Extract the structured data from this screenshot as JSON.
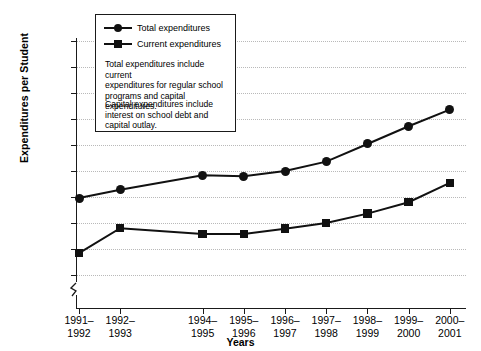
{
  "chart_data": {
    "type": "line",
    "title": "",
    "xlabel": "Years",
    "ylabel": "Expenditures per Student",
    "categories": [
      "1991–\n1992",
      "1992–\n1993",
      "1994–\n1995",
      "1995–\n1996",
      "1996–\n1997",
      "1997–\n1998",
      "1998–\n1999",
      "1999–\n2000",
      "2000–\n2001"
    ],
    "category_lines": [
      [
        "1991–",
        "1992"
      ],
      [
        "1992–",
        "1993"
      ],
      [
        "1994–",
        "1995"
      ],
      [
        "1995–",
        "1996"
      ],
      [
        "1996–",
        "1997"
      ],
      [
        "1997–",
        "1998"
      ],
      [
        "1998–",
        "1999"
      ],
      [
        "1999–",
        "2000"
      ],
      [
        "2000–",
        "2001"
      ]
    ],
    "series": [
      {
        "name": "Total expenditures",
        "marker": "circle",
        "values": [
          6980,
          7140,
          7420,
          7400,
          7500,
          7680,
          8020,
          8360,
          8680
        ]
      },
      {
        "name": "Current expenditures",
        "marker": "square",
        "values": [
          5920,
          6400,
          6290,
          6290,
          6390,
          6500,
          6680,
          6900,
          7270
        ]
      }
    ],
    "ytick_labels": [
      "10,000",
      "9,500",
      "9,000",
      "8,500",
      "8,000",
      "7,500",
      "7,000",
      "6,500",
      "6,000",
      "5,500",
      "0"
    ],
    "ytick_values": [
      10000,
      9500,
      9000,
      8500,
      8000,
      7500,
      7000,
      6500,
      6000,
      5500,
      0
    ],
    "ylim": [
      5500,
      10000
    ],
    "axis_break": true,
    "grid": true,
    "legend_position": "top-left-inside"
  },
  "legend": {
    "entries": [
      {
        "label": "Total expenditures",
        "marker": "circle"
      },
      {
        "label": "Current expenditures",
        "marker": "square"
      }
    ]
  },
  "notes": {
    "note1_line1": "Total expenditures include current",
    "note1_line2": "expenditures for regular school",
    "note1_line3": "programs and capital expenditures.",
    "note2_line1": "Capital expenditures include",
    "note2_line2": "interest on school debt and",
    "note2_line3": "capital outlay."
  },
  "colors": {
    "series": "#111111",
    "grid": "#b9b9b9",
    "axis": "#1a1a1a",
    "background": "#ffffff"
  }
}
